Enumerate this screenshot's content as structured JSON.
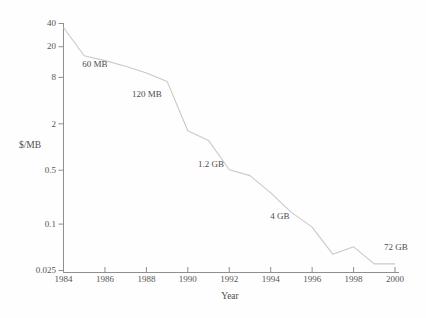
{
  "figure": {
    "ylabel": "$/MB",
    "xlabel": "Year"
  },
  "colors": {
    "curve": "#c9c9c9",
    "axis": "#8f8f8f",
    "text": "#555555",
    "background": "#fefefe"
  },
  "chart_data": {
    "type": "line",
    "title": "",
    "xlabel": "Year",
    "ylabel": "$/MB",
    "yscale": "log",
    "grid": false,
    "legend": false,
    "xlim": [
      1984,
      2000
    ],
    "ylim": [
      0.025,
      40
    ],
    "x": [
      1984,
      1985,
      1986,
      1987,
      1988,
      1989,
      1990,
      1991,
      1992,
      1993,
      1994,
      1995,
      1996,
      1997,
      1998,
      1999,
      2000
    ],
    "values": [
      35,
      15,
      13,
      11,
      9,
      7,
      1.6,
      1.2,
      0.5,
      0.42,
      0.25,
      0.14,
      0.09,
      0.04,
      0.05,
      0.03,
      0.03
    ],
    "yticks": [
      "40",
      "20",
      "8",
      "2",
      "0.5",
      "0.1",
      "0.025"
    ],
    "xticks": [
      "1984",
      "1986",
      "1988",
      "1990",
      "1992",
      "1994",
      "1996",
      "1998",
      "2000"
    ],
    "annotations": [
      {
        "label": "60 MB",
        "x_px": 95,
        "y_px": 63
      },
      {
        "label": "120 MB",
        "x_px": 147,
        "y_px": 93
      },
      {
        "label": "1.2 GB",
        "x_px": 211,
        "y_px": 163
      },
      {
        "label": "4 GB",
        "x_px": 280,
        "y_px": 215
      },
      {
        "label": "72 GB",
        "x_px": 396,
        "y_px": 246
      }
    ]
  }
}
